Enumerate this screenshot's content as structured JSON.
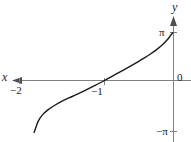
{
  "figure": {
    "kind": "cartesian-plot",
    "background_color": "#ffffff",
    "axis_color": "#808080",
    "curve_color": "#1a1a1a",
    "text_color": "#1a1a1a"
  },
  "axes": {
    "x_axis_label": "x",
    "y_axis_label": "y",
    "origin_label": "0",
    "x_ticks": [
      {
        "label": "−2",
        "value": -2
      },
      {
        "label": "−1",
        "value": -1
      }
    ],
    "y_ticks": [
      {
        "label": "π",
        "value": 3.14159
      },
      {
        "label": "−π",
        "value": -3.14159
      }
    ],
    "x_arrow_direction": "left",
    "y_arrow_direction": "up"
  },
  "chart_data": {
    "type": "line",
    "title": "",
    "xlabel": "x",
    "ylabel": "y",
    "xlim": [
      -2.35,
      0.12
    ],
    "ylim": [
      -3.6,
      3.6
    ],
    "grid": false,
    "legend_position": "none",
    "x_tick_labels": [
      "−2",
      "−1"
    ],
    "x_tick_values": [
      -2,
      -1
    ],
    "y_tick_labels": [
      "π",
      "0",
      "−π"
    ],
    "y_tick_values": [
      3.14159,
      0,
      -3.14159
    ],
    "annotations": [
      "curve passes through (−1, 0)",
      "curve rises steeply toward y = π as x approaches 0 from the left",
      "curve falls steeply toward y = −π near x = −2"
    ],
    "series": [
      {
        "name": "y",
        "x": [
          -2.02,
          -2.0,
          -1.96,
          -1.9,
          -1.82,
          -1.72,
          -1.6,
          -1.46,
          -1.3,
          -1.15,
          -1.0,
          -0.86,
          -0.72,
          -0.58,
          -0.46,
          -0.34,
          -0.24,
          -0.16,
          -0.1,
          -0.06,
          -0.03,
          -0.01
        ],
        "y": [
          -3.4,
          -3.14,
          -2.66,
          -2.25,
          -1.92,
          -1.62,
          -1.32,
          -1.03,
          -0.69,
          -0.35,
          0.0,
          0.35,
          0.69,
          1.05,
          1.38,
          1.72,
          2.04,
          2.34,
          2.62,
          2.84,
          3.02,
          3.12
        ]
      }
    ]
  }
}
